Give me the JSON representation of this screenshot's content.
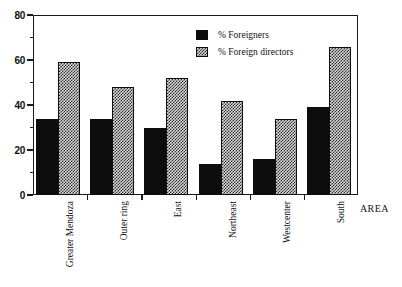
{
  "chart_data": {
    "type": "bar",
    "title": "",
    "subtitle": "",
    "xlabel": "AREA",
    "ylabel": "",
    "categories": [
      "Greater Mendoza",
      "Outer ring",
      "East",
      "Northeast",
      "Westcenter",
      "South"
    ],
    "series": [
      {
        "name": "% Foreigners",
        "values": [
          34,
          34,
          30,
          14,
          16,
          39
        ],
        "color": "#0d0d0d",
        "pattern": "solid-black"
      },
      {
        "name": "% Foreign directors",
        "values": [
          59,
          48,
          52,
          42,
          34,
          66
        ],
        "color": "#d8d8d8",
        "pattern": "fine-checker-stipple"
      }
    ],
    "ylim": [
      0,
      80
    ],
    "yticks_major": [
      0,
      20,
      40,
      60,
      80
    ],
    "yticks_minor": [
      10,
      30,
      50,
      70
    ],
    "ytick_labels": [
      "0",
      "20",
      "40",
      "60",
      "80"
    ],
    "grid": false,
    "legend_position": "top-center-right",
    "annotations": []
  },
  "legend": {
    "items": [
      {
        "label": "% Foreigners"
      },
      {
        "label": "% Foreign directors"
      }
    ]
  },
  "axis": {
    "x_title": "AREA",
    "y_tick_labels": [
      "80",
      "60",
      "40",
      "20",
      "0"
    ]
  }
}
